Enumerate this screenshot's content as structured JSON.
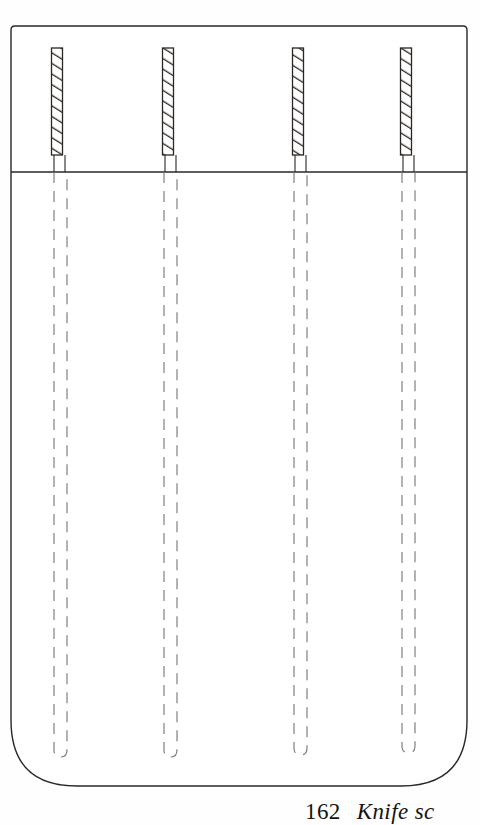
{
  "document": {
    "kind": "line-drawing-plate",
    "page_background": "#fefefe",
    "ink_color": "#2b2724",
    "faint_ink_color": "#8d8a87"
  },
  "figure": {
    "outline": {
      "left": 11,
      "top": 26,
      "right": 467,
      "bottom": 786,
      "top_corner_radius": 4,
      "bottom_corner_radius": 66,
      "stroke_color": "#2b2724",
      "stroke_width": 1.4
    },
    "divider": {
      "label": "upper-band-divider",
      "y": 172,
      "x_start": 11,
      "x_end": 467,
      "stroke_color": "#2b2724",
      "stroke_width": 1.3
    },
    "hatched_bars": {
      "count": 4,
      "top": 48,
      "bottom": 155,
      "width": 11,
      "hatch_stripes": 5,
      "hatch_direction": "lower-left-to-upper-right",
      "stroke_color": "#2b2724",
      "centers_x": [
        57,
        168,
        298,
        406
      ]
    },
    "dashed_channels": {
      "count": 4,
      "top": 172,
      "bottom": 755,
      "pair_gap": 11,
      "dash_length": 11,
      "dash_gap": 8,
      "stroke_color": "#7d7a77",
      "stroke_width": 1.1,
      "bottom_cap": "u-turn",
      "bottom_cap_radius": 5,
      "centers_x": [
        60,
        170,
        300,
        408
      ]
    },
    "stub_ticks": {
      "label": "bar-foot-ticks",
      "y_top": 155,
      "y_bottom": 172,
      "stroke_color": "#2b2724"
    }
  },
  "caption": {
    "number": "162",
    "text": "Knife sc",
    "truncated": true
  }
}
